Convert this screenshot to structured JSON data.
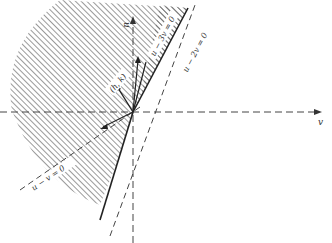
{
  "figure": {
    "axes": {
      "horizontal_label": "v",
      "vertical_label": "u"
    },
    "lines": [
      {
        "id": "line-u-3v",
        "label": "u − 3v = 0",
        "style": "solid"
      },
      {
        "id": "line-u-2v",
        "label": "u − 2v = 0",
        "style": "dashed"
      },
      {
        "id": "line-u-v",
        "label": "u − v = 0",
        "style": "dashed"
      }
    ],
    "vector_label": "(h, k)",
    "colors": {
      "ink": "#2a2a2a",
      "hatch": "#555555",
      "background": "#ffffff"
    }
  }
}
